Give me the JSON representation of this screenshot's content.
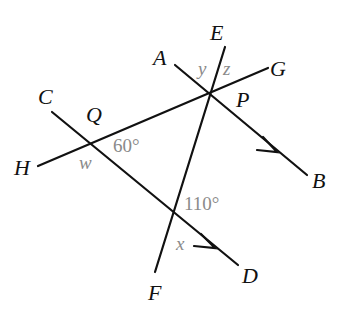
{
  "diagram": {
    "type": "geometry-parallel-lines",
    "points": {
      "A": "A",
      "B": "B",
      "C": "C",
      "D": "D",
      "E": "E",
      "F": "F",
      "G": "G",
      "H": "H",
      "P": "P",
      "Q": "Q"
    },
    "angles": {
      "angle_60": "60°",
      "angle_110": "110°",
      "w": "w",
      "x": "x",
      "y": "y",
      "z": "z"
    },
    "colors": {
      "line": "#111111",
      "angle_label": "#8a8a8a",
      "background": "#ffffff"
    }
  }
}
